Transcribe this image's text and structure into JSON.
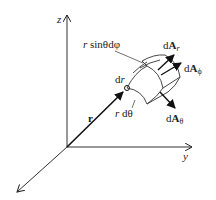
{
  "diagram": {
    "axes": {
      "z_label": "z",
      "y_label": "y",
      "x_label": ""
    },
    "vector": {
      "label": "r"
    },
    "labels": {
      "r_sin_theta_dphi_r": "r",
      "r_sin_theta_dphi_rest": " sinθdφ",
      "dr_d": "d",
      "dr_r": "r",
      "rdtheta_r": "r",
      "rdtheta_rest": " dθ",
      "dA_r_d": "d",
      "dA_r_A": "A",
      "dA_r_sub": "r",
      "dA_phi_d": "d",
      "dA_phi_A": "A",
      "dA_phi_sub": "ϕ",
      "dA_theta_d": "d",
      "dA_theta_A": "A",
      "dA_theta_sub": "θ"
    },
    "colors": {
      "ink": "#222222",
      "background": "#ffffff"
    }
  }
}
